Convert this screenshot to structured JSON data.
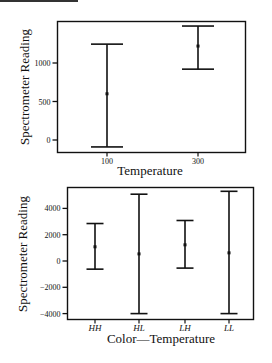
{
  "chart_data": [
    {
      "type": "errorbar",
      "title": "",
      "xlabel": "Temperature",
      "ylabel": "Spectrometer Reading",
      "categories": [
        "100",
        "300"
      ],
      "series": [
        {
          "name": "mean",
          "values": [
            600,
            1220
          ]
        },
        {
          "name": "upper",
          "values": [
            1245,
            1480
          ]
        },
        {
          "name": "lower",
          "values": [
            -90,
            920
          ]
        }
      ],
      "yticks": [
        0,
        500,
        1000
      ],
      "ytick_labels": [
        "0",
        "500",
        "1000"
      ],
      "ylim": [
        -220,
        1550
      ],
      "grid": false,
      "legend": "none"
    },
    {
      "type": "errorbar",
      "title": "",
      "xlabel": "Color—Temperature",
      "ylabel": "Spectrometer Reading",
      "categories": [
        "HH",
        "HL",
        "LH",
        "LL"
      ],
      "series": [
        {
          "name": "mean",
          "values": [
            1080,
            540,
            1230,
            620
          ]
        },
        {
          "name": "upper",
          "values": [
            2850,
            5080,
            3080,
            5300
          ]
        },
        {
          "name": "lower",
          "values": [
            -620,
            -4000,
            -540,
            -4000
          ]
        }
      ],
      "yticks": [
        -4000,
        -2000,
        0,
        2000,
        4000
      ],
      "ytick_labels": [
        "-4000",
        "-2000",
        "0",
        "2000",
        "4000"
      ],
      "ylim": [
        -4400,
        5700
      ],
      "grid": false,
      "legend": "none"
    }
  ]
}
